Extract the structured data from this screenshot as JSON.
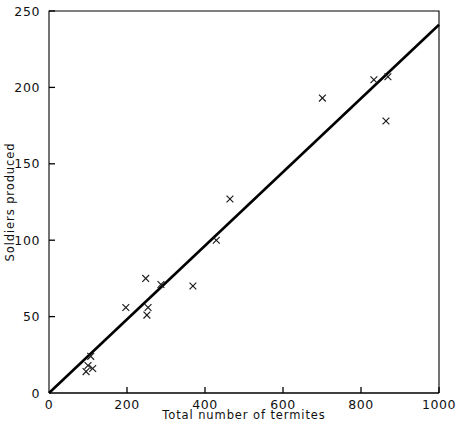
{
  "chart_data": {
    "type": "scatter",
    "title": "",
    "xlabel": "Total number of termites",
    "ylabel": "Soldiers produced",
    "xlim": [
      0,
      1000
    ],
    "ylim": [
      0,
      250
    ],
    "xticks": [
      0,
      200,
      400,
      600,
      800,
      1000
    ],
    "xtick_labels": [
      "0",
      "200",
      "400",
      "600",
      "800",
      "1000"
    ],
    "yticks": [
      0,
      50,
      100,
      150,
      200,
      250
    ],
    "ytick_labels": [
      "0",
      "50",
      "100",
      "150",
      "200",
      "250"
    ],
    "grid": false,
    "legend": null,
    "marker_symbol": "x",
    "points": [
      {
        "x": 95,
        "y": 14
      },
      {
        "x": 100,
        "y": 18
      },
      {
        "x": 107,
        "y": 24
      },
      {
        "x": 112,
        "y": 16
      },
      {
        "x": 197,
        "y": 56
      },
      {
        "x": 248,
        "y": 75
      },
      {
        "x": 251,
        "y": 51
      },
      {
        "x": 254,
        "y": 56
      },
      {
        "x": 287,
        "y": 71
      },
      {
        "x": 369,
        "y": 70
      },
      {
        "x": 429,
        "y": 100
      },
      {
        "x": 464,
        "y": 127
      },
      {
        "x": 701,
        "y": 193
      },
      {
        "x": 833,
        "y": 205
      },
      {
        "x": 864,
        "y": 178
      },
      {
        "x": 869,
        "y": 207
      }
    ],
    "fit_line": {
      "type": "linear",
      "x_start": 0,
      "y_start": 0,
      "x_end": 1000,
      "y_end": 241
    }
  },
  "axes": {
    "x_axis_name": "x-axis",
    "y_axis_name": "y-axis"
  }
}
